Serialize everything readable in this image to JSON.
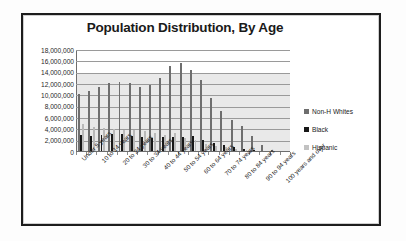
{
  "frame": {
    "border_color": "#1d1d1d"
  },
  "legend": {
    "position": "right",
    "items": [
      {
        "label": "Non-H Whites",
        "color": "#6e6e6e",
        "swatch": "square-icon"
      },
      {
        "label": "Black",
        "color": "#171717",
        "swatch": "square-icon"
      },
      {
        "label": "Hispanic",
        "color": "#c2c2c2",
        "swatch": "square-icon"
      }
    ]
  },
  "chart_data": {
    "type": "bar",
    "title": "Population Distribution, By Age",
    "xlabel": "",
    "ylabel": "",
    "ylim": [
      0,
      18000000
    ],
    "grid": true,
    "legend_position": "right",
    "ytick_labels": [
      "18,000,000",
      "16,000,000",
      "14,000,000",
      "12,000,000",
      "10,000,000",
      "8,000,000",
      "6,000,000",
      "4,000,000",
      "2,000,000",
      "0"
    ],
    "ytick_values": [
      18000000,
      16000000,
      14000000,
      12000000,
      10000000,
      8000000,
      6000000,
      4000000,
      2000000,
      0
    ],
    "categories": [
      "Under 5 years",
      "5 to 9 years",
      "10 to 14 years",
      "15 to 19 years",
      "20 to 24 years",
      "25 to 29 years",
      "30 to 34 years",
      "35 to 39 years",
      "40 to 44 years",
      "45 to 49 years",
      "50 to 54 years",
      "55 to 59 years",
      "60 to 64 years",
      "65 to 69 years",
      "70 to 74 years",
      "75 to 79 years",
      "80 to 84 years",
      "85 to 89 years",
      "90 to 94 years",
      "95 to 99 years",
      "100 years and over"
    ],
    "xtick_labels_shown": [
      "Under 5 years",
      "10 to 14 years",
      "20 to 24 years",
      "30 to 34 years",
      "40 to 44 years",
      "50 to 54 years",
      "60 to 64 years",
      "70 to 74 years",
      "80 to 84 years",
      "90 to 94 years",
      "100 years and over"
    ],
    "series": [
      {
        "name": "Non-H Whites",
        "color": "#6e6e6e",
        "values": [
          10200000,
          10800000,
          11400000,
          12100000,
          12400000,
          12200000,
          11400000,
          11900000,
          13100000,
          15200000,
          15700000,
          14400000,
          12700000,
          9600000,
          7200000,
          5700000,
          4600000,
          2900000,
          1300000,
          420000,
          70000
        ]
      },
      {
        "name": "Black",
        "color": "#171717",
        "values": [
          3000000,
          2800000,
          3000000,
          3250000,
          3100000,
          2750000,
          2650000,
          2550000,
          2600000,
          2700000,
          2650000,
          2750000,
          2150000,
          1600000,
          1150000,
          800000,
          620000,
          390000,
          170000,
          55000,
          12000
        ]
      },
      {
        "name": "Hispanic",
        "color": "#b9b9b9",
        "values": [
          4900000,
          4500000,
          4300000,
          4100000,
          3950000,
          3850000,
          3700000,
          3300000,
          3000000,
          3350000,
          2500000,
          2050000,
          1500000,
          1100000,
          830000,
          600000,
          420000,
          250000,
          110000,
          36000,
          8000
        ]
      }
    ]
  }
}
